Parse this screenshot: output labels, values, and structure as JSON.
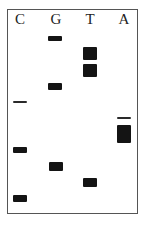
{
  "figure": {
    "lanes": [
      {
        "label": "C",
        "bands": [
          {
            "relative_position": 0.45,
            "intensity": "faint"
          },
          {
            "relative_position": 0.67,
            "intensity": "strong"
          },
          {
            "relative_position": 0.92,
            "intensity": "strong"
          }
        ]
      },
      {
        "label": "G",
        "bands": [
          {
            "relative_position": 0.14,
            "intensity": "strong"
          },
          {
            "relative_position": 0.37,
            "intensity": "strong"
          },
          {
            "relative_position": 0.76,
            "intensity": "strong"
          }
        ]
      },
      {
        "label": "T",
        "bands": [
          {
            "relative_position": 0.22,
            "intensity": "very strong"
          },
          {
            "relative_position": 0.3,
            "intensity": "very strong"
          },
          {
            "relative_position": 0.84,
            "intensity": "strong"
          }
        ]
      },
      {
        "label": "A",
        "bands": [
          {
            "relative_position": 0.53,
            "intensity": "faint"
          },
          {
            "relative_position": 0.62,
            "intensity": "very strong"
          }
        ]
      }
    ],
    "colors": {
      "band": "#141414",
      "border": "#555555",
      "background": "#ffffff"
    }
  }
}
